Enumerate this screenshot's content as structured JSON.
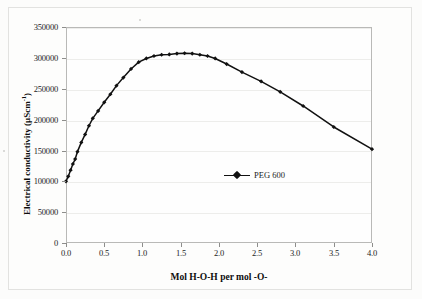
{
  "figure": {
    "background_color": "#fdfdfc",
    "frame_color": "#b9b9b7",
    "series_color": "#111111",
    "grid_color": "#ededeb"
  },
  "legend": {
    "position": "inside-center",
    "entries": [
      {
        "label": "PEG 600",
        "marker": "filled-diamond",
        "color": "#111111"
      }
    ]
  },
  "axis": {
    "y_title_main": "Electrical conductivity (",
    "y_title_unit_base": "µScm",
    "y_title_unit_exp": "-1",
    "y_title_close": ")",
    "x_title": "Mol H-O-H per mol -O-",
    "y_ticks": [
      "0",
      "50000",
      "100000",
      "150000",
      "200000",
      "250000",
      "300000",
      "350000"
    ],
    "x_ticks": [
      "0.0",
      "0.5",
      "1.0",
      "1.5",
      "2.0",
      "2.5",
      "3.0",
      "3.5",
      "4.0"
    ]
  },
  "chart_data": {
    "type": "line",
    "title": "",
    "subtitle": "",
    "xlabel": "Mol H-O-H per mol -O-",
    "ylabel": "Electrical conductivity (µScm-1)",
    "xlim": [
      0.0,
      4.0
    ],
    "ylim": [
      0,
      350000
    ],
    "xtick_step": 0.5,
    "ytick_step": 50000,
    "grid": true,
    "grid_axis": "y",
    "legend_position": "inside-center",
    "marker": "filled-diamond",
    "series": [
      {
        "name": "PEG 600",
        "color": "#111111",
        "x": [
          0.0,
          0.03,
          0.06,
          0.09,
          0.12,
          0.15,
          0.2,
          0.25,
          0.3,
          0.35,
          0.42,
          0.5,
          0.58,
          0.66,
          0.75,
          0.85,
          0.95,
          1.05,
          1.15,
          1.25,
          1.35,
          1.45,
          1.55,
          1.65,
          1.75,
          1.85,
          1.95,
          2.1,
          2.3,
          2.55,
          2.8,
          3.1,
          3.5,
          4.0
        ],
        "y": [
          100000,
          108000,
          118000,
          128000,
          136000,
          148000,
          163000,
          176000,
          190000,
          202000,
          214000,
          228000,
          241000,
          255000,
          268000,
          282000,
          293000,
          299000,
          303000,
          305000,
          305500,
          307000,
          307500,
          307000,
          305000,
          303000,
          299000,
          290000,
          277000,
          262000,
          245000,
          222000,
          188000,
          152000
        ]
      }
    ]
  }
}
